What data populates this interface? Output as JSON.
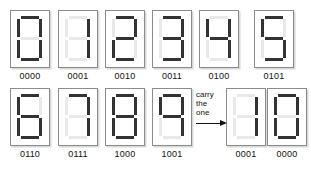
{
  "figure": {
    "title": "",
    "colors": {
      "segment_on": "#333333",
      "segment_off": "#e9e9e9",
      "panel_border": "#8c8c8c",
      "panel_background": "#ffffff",
      "text": "#111111",
      "page_background": "#ffffff"
    },
    "annotation": {
      "lines": [
        "carry",
        "the",
        "one"
      ],
      "arrow": "right-arrow"
    }
  },
  "rows": [
    {
      "name": "row-top",
      "cells": [
        {
          "label": "0000",
          "digit": "0",
          "segments": {
            "a": true,
            "b": true,
            "c": true,
            "d": true,
            "e": true,
            "f": true,
            "g": false
          }
        },
        {
          "label": "0001",
          "digit": "1",
          "segments": {
            "a": false,
            "b": true,
            "c": true,
            "d": false,
            "e": false,
            "f": false,
            "g": false
          }
        },
        {
          "label": "0010",
          "digit": "2",
          "segments": {
            "a": true,
            "b": true,
            "c": false,
            "d": true,
            "e": true,
            "f": false,
            "g": true
          }
        },
        {
          "label": "0011",
          "digit": "3",
          "segments": {
            "a": true,
            "b": true,
            "c": true,
            "d": true,
            "e": false,
            "f": false,
            "g": true
          }
        },
        {
          "label": "0100",
          "digit": "4",
          "segments": {
            "a": false,
            "b": true,
            "c": true,
            "d": false,
            "e": false,
            "f": true,
            "g": true
          }
        },
        {
          "label": "0101",
          "digit": "5",
          "segments": {
            "a": true,
            "b": false,
            "c": true,
            "d": true,
            "e": false,
            "f": true,
            "g": true
          }
        }
      ]
    },
    {
      "name": "row-bottom",
      "cells": [
        {
          "label": "0110",
          "digit": "6",
          "segments": {
            "a": true,
            "b": false,
            "c": true,
            "d": true,
            "e": true,
            "f": true,
            "g": true
          }
        },
        {
          "label": "0111",
          "digit": "7",
          "segments": {
            "a": true,
            "b": true,
            "c": true,
            "d": false,
            "e": false,
            "f": false,
            "g": false
          }
        },
        {
          "label": "1000",
          "digit": "8",
          "segments": {
            "a": true,
            "b": true,
            "c": true,
            "d": true,
            "e": true,
            "f": true,
            "g": true
          }
        },
        {
          "label": "1001",
          "digit": "9",
          "segments": {
            "a": true,
            "b": true,
            "c": true,
            "d": false,
            "e": false,
            "f": true,
            "g": true
          }
        },
        {
          "label": "0001",
          "digit": "1",
          "segments": {
            "a": false,
            "b": true,
            "c": true,
            "d": false,
            "e": false,
            "f": false,
            "g": false
          }
        },
        {
          "label": "0000",
          "digit": "0",
          "segments": {
            "a": true,
            "b": true,
            "c": true,
            "d": true,
            "e": true,
            "f": true,
            "g": false
          }
        }
      ]
    }
  ]
}
